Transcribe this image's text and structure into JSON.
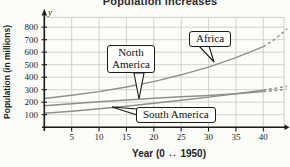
{
  "title": "Population increases",
  "axes": {
    "x": {
      "label": "Year (0 ↔ 1950)",
      "ticks": [
        5,
        10,
        15,
        20,
        25,
        30,
        35,
        40
      ],
      "min": 0,
      "max": 43.8
    },
    "y": {
      "label": "Population (in millions)",
      "axis_var": "y",
      "ticks": [
        100,
        200,
        300,
        400,
        500,
        600,
        700,
        800
      ],
      "min": 0,
      "max": 879
    }
  },
  "chart_data": {
    "type": "line",
    "title": "Population increases",
    "xlabel": "Year (0 ↔ 1950)",
    "ylabel": "Population (in millions)",
    "x": [
      0,
      5,
      10,
      15,
      20,
      25,
      30,
      35,
      40
    ],
    "xlim": [
      0,
      44
    ],
    "ylim": [
      0,
      880
    ],
    "grid": true,
    "x_note": "x = years after 1950; dashed segments are projections beyond year 40",
    "series": [
      {
        "name": "Africa",
        "values": [
          230,
          256,
          285,
          322,
          365,
          419,
          480,
          556,
          645
        ],
        "projection_x": [
          40,
          42,
          44.4
        ],
        "projection_values": [
          645,
          700,
          788
        ]
      },
      {
        "name": "North America",
        "values": [
          172,
          187,
          204,
          218,
          231,
          243,
          254,
          267,
          285
        ],
        "projection_x": [
          40,
          44.3
        ],
        "projection_values": [
          285,
          303
        ]
      },
      {
        "name": "South America",
        "values": [
          112,
          128,
          147,
          168,
          191,
          215,
          241,
          268,
          296
        ],
        "projection_x": [
          40,
          44.3
        ],
        "projection_values": [
          296,
          327
        ]
      }
    ],
    "annotations": [
      {
        "label": "Africa",
        "box": {
          "left": 189,
          "top": 31,
          "width": null
        },
        "wrap": false,
        "tail": [
          [
            199,
            46
          ],
          [
            209,
            46
          ],
          [
            214,
            62
          ]
        ]
      },
      {
        "label": "North America",
        "box": {
          "left": 107,
          "top": 45,
          "width": 48
        },
        "wrap": true,
        "tail": [
          [
            134,
            73
          ],
          [
            144,
            73
          ],
          [
            139,
            99
          ]
        ]
      },
      {
        "label": "South America",
        "box": {
          "left": 136,
          "top": 107,
          "width": null
        },
        "wrap": false,
        "tail": [
          [
            137,
            109
          ],
          [
            137,
            115
          ],
          [
            112,
            107
          ]
        ]
      }
    ]
  },
  "colors": {
    "background": "#fcfcf9",
    "grid": "#c8c8c6",
    "curve": "#8e8e8c",
    "axis": "#1b1b1b",
    "text": "#2a2a2a",
    "callout_border": "#1b1b1b",
    "callout_bg": "#fdfdfb"
  }
}
